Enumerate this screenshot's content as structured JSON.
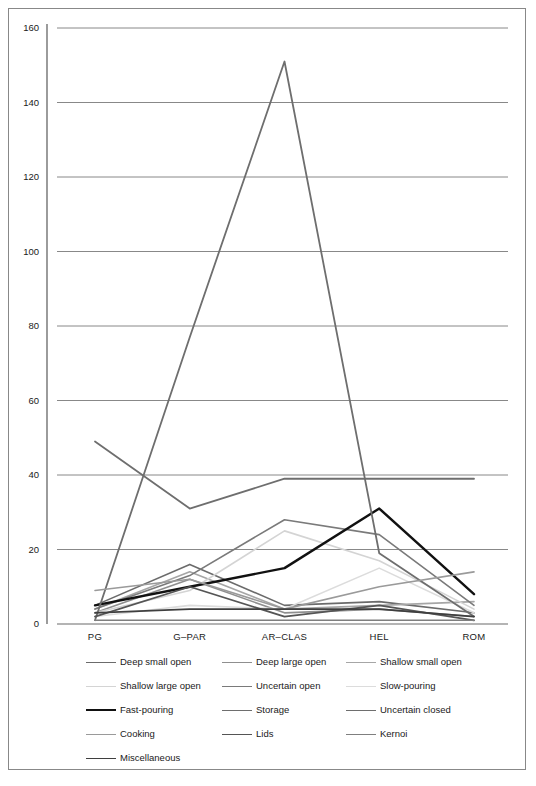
{
  "chart_data": {
    "type": "line",
    "title": "",
    "xlabel": "",
    "ylabel": "",
    "categories": [
      "PG",
      "G–PAR",
      "AR–CLAS",
      "HEL",
      "ROM"
    ],
    "ylim": [
      0,
      160
    ],
    "yticks": [
      0,
      20,
      40,
      60,
      80,
      100,
      120,
      140,
      160
    ],
    "grid": true,
    "legend_position": "bottom",
    "series": [
      {
        "name": "Deep small open",
        "color": "#6b6b6b",
        "width": 1.6,
        "values": [
          5,
          16,
          5,
          6,
          3
        ]
      },
      {
        "name": "Deep large open",
        "color": "#8f8f8f",
        "width": 1.6,
        "values": [
          3,
          12,
          3,
          4,
          2
        ]
      },
      {
        "name": "Shallow small open",
        "color": "#a6a6a6",
        "width": 1.6,
        "values": [
          4,
          14,
          4,
          5,
          6
        ]
      },
      {
        "name": "Shallow large open",
        "color": "#d4d4d4",
        "width": 1.6,
        "values": [
          3,
          9,
          25,
          17,
          4
        ]
      },
      {
        "name": "Uncertain open",
        "color": "#7a7a7a",
        "width": 1.6,
        "values": [
          4,
          13,
          28,
          24,
          5
        ]
      },
      {
        "name": "Slow-pouring",
        "color": "#dcdcdc",
        "width": 1.6,
        "values": [
          2,
          5,
          4,
          15,
          3
        ]
      },
      {
        "name": "Fast-pouring",
        "color": "#111111",
        "width": 2.4,
        "values": [
          5,
          10,
          15,
          31,
          8
        ]
      },
      {
        "name": "Storage",
        "color": "#6e6e6e",
        "width": 1.8,
        "values": [
          49,
          31,
          39,
          39,
          39
        ]
      },
      {
        "name": "Uncertain closed",
        "color": "#6e6e6e",
        "width": 1.8,
        "values": [
          1,
          77,
          151,
          19,
          2
        ]
      },
      {
        "name": "Cooking",
        "color": "#9a9a9a",
        "width": 1.6,
        "values": [
          9,
          12,
          4,
          10,
          14
        ]
      },
      {
        "name": "Lids",
        "color": "#555555",
        "width": 1.8,
        "values": [
          2,
          10,
          2,
          5,
          1
        ]
      },
      {
        "name": "Kernoi",
        "color": "#7f7f7f",
        "width": 1.6,
        "values": [
          1,
          1,
          1,
          1,
          1
        ]
      },
      {
        "name": "Miscellaneous",
        "color": "#3f3f3f",
        "width": 1.8,
        "values": [
          3,
          4,
          4,
          4,
          2
        ]
      }
    ]
  },
  "axes": {
    "y_tick_labels": [
      "160",
      "140",
      "120",
      "100",
      "80",
      "60",
      "40",
      "20",
      "0"
    ],
    "x_tick_labels": [
      "PG",
      "G–PAR",
      "AR–CLAS",
      "HEL",
      "ROM"
    ]
  },
  "legend": {
    "rows": [
      [
        {
          "label": "Deep small open",
          "color": "#6b6b6b",
          "width": 1.6
        },
        {
          "label": "Deep large open",
          "color": "#8f8f8f",
          "width": 1.6
        },
        {
          "label": "Shallow small open",
          "color": "#a6a6a6",
          "width": 1.6
        }
      ],
      [
        {
          "label": "Shallow large open",
          "color": "#d4d4d4",
          "width": 1.6
        },
        {
          "label": "Uncertain open",
          "color": "#7a7a7a",
          "width": 1.6
        },
        {
          "label": "Slow-pouring",
          "color": "#dcdcdc",
          "width": 1.6
        }
      ],
      [
        {
          "label": "Fast-pouring",
          "color": "#111111",
          "width": 2.4
        },
        {
          "label": "Storage",
          "color": "#6e6e6e",
          "width": 1.8
        },
        {
          "label": "Uncertain closed",
          "color": "#6e6e6e",
          "width": 1.8
        }
      ],
      [
        {
          "label": "Cooking",
          "color": "#9a9a9a",
          "width": 1.6
        },
        {
          "label": "Lids",
          "color": "#555555",
          "width": 1.8
        },
        {
          "label": "Kernoi",
          "color": "#7f7f7f",
          "width": 1.6
        }
      ],
      [
        {
          "label": "Miscellaneous",
          "color": "#3f3f3f",
          "width": 1.8
        }
      ]
    ]
  },
  "colors": {
    "frame": "#888888",
    "axis": "#595959",
    "gridline": "#6a6a6a",
    "background": "#ffffff",
    "text": "#1a1a1a"
  }
}
